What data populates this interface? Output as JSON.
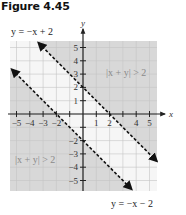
{
  "figure": {
    "title": "Figure 4.45"
  },
  "colors": {
    "shaded": "#d8d8d8",
    "unshaded": "#f6f6f6",
    "grid": "#c4c4c4",
    "axis": "#222222",
    "line": "#111111",
    "region_label": "#8a8a8a"
  },
  "chart_data": {
    "type": "inequality-graph",
    "title": "Figure 4.45",
    "xlabel": "x",
    "ylabel": "y",
    "xlim": [
      -5.5,
      5.5
    ],
    "ylim": [
      -5.5,
      5.5
    ],
    "grid": true,
    "x_tick_labels": [
      "-5",
      "-4",
      "-3",
      "-2",
      "1",
      "2",
      "4",
      "5"
    ],
    "y_tick_labels": [
      "5",
      "4",
      "3",
      "2",
      "1",
      "-2",
      "-3",
      "-4",
      "-5"
    ],
    "boundary_lines": [
      {
        "equation": "y = −x + 2",
        "style": "dashed",
        "slope": -1,
        "intercept": 2
      },
      {
        "equation": "y = −x − 2",
        "style": "dashed",
        "slope": -1,
        "intercept": -2
      }
    ],
    "shaded_regions": [
      {
        "label": "|x + y| > 2",
        "description": "region above y = −x + 2"
      },
      {
        "label": "|x + y| > 2",
        "description": "region below y = −x − 2"
      }
    ],
    "annotations": [
      {
        "text": "y = −x + 2",
        "position": "top-left"
      },
      {
        "text": "y = −x − 2",
        "position": "bottom-right"
      },
      {
        "text": "|x + y| > 2",
        "position": "upper-right region"
      },
      {
        "text": "|x + y| > 2",
        "position": "lower-left region"
      }
    ]
  },
  "labels": {
    "top_line": "y = −x + 2",
    "bottom_line": "y = −x − 2",
    "region_upper": "|x + y| > 2",
    "region_lower": "|x + y| > 2",
    "x_axis": "x",
    "y_axis": "y"
  },
  "ticks": {
    "x": [
      {
        "v": -5,
        "label": "−5"
      },
      {
        "v": -4,
        "label": "−4"
      },
      {
        "v": -3,
        "label": "−3"
      },
      {
        "v": -2,
        "label": "−2"
      },
      {
        "v": 1,
        "label": "1"
      },
      {
        "v": 2,
        "label": "2"
      },
      {
        "v": 4,
        "label": "4"
      },
      {
        "v": 5,
        "label": "5"
      }
    ],
    "y": [
      {
        "v": 5,
        "label": "5"
      },
      {
        "v": 4,
        "label": "4"
      },
      {
        "v": 3,
        "label": "3"
      },
      {
        "v": 2,
        "label": "2"
      },
      {
        "v": 1,
        "label": "1"
      },
      {
        "v": -2,
        "label": "−2"
      },
      {
        "v": -3,
        "label": "−3"
      },
      {
        "v": -4,
        "label": "−4"
      },
      {
        "v": -5,
        "label": "−5"
      }
    ]
  }
}
